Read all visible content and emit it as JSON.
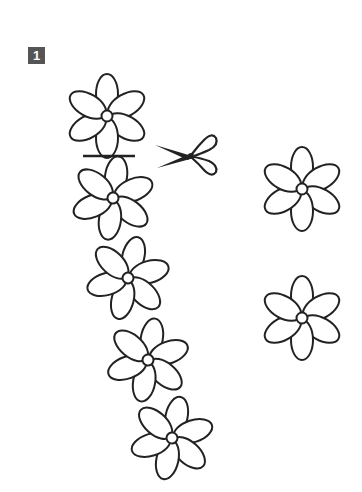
{
  "step": {
    "number": "1"
  },
  "colors": {
    "line": "#222222",
    "badge_bg": "#555555",
    "badge_text": "#ffffff",
    "background": "#ffffff"
  },
  "icons": {
    "scissors": "scissors-icon",
    "cut_line": "cut-line"
  },
  "flower_chain": [
    {
      "cx": 107,
      "cy": 116,
      "rot": 0
    },
    {
      "cx": 113,
      "cy": 198,
      "rot": 8
    },
    {
      "cx": 128,
      "cy": 278,
      "rot": 14
    },
    {
      "cx": 148,
      "cy": 360,
      "rot": 10
    },
    {
      "cx": 172,
      "cy": 438,
      "rot": 12
    }
  ],
  "cut_flowers": [
    {
      "cx": 302,
      "cy": 189,
      "rot": 0
    },
    {
      "cx": 302,
      "cy": 318,
      "rot": 0
    }
  ],
  "cut_line": {
    "x1": 83,
    "y1": 156,
    "x2": 135,
    "y2": 156
  }
}
